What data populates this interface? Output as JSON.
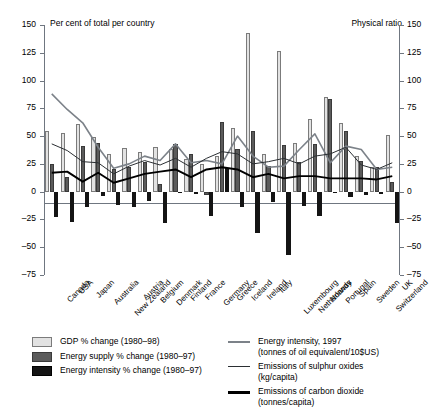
{
  "left_axis_title": "Per cent of total per country",
  "right_axis_title": "Physical ratio",
  "legend": {
    "bars": [
      {
        "key": "gdp",
        "label": "GDP % change (1980–98)",
        "color": "#e2e2e2"
      },
      {
        "key": "supply",
        "label": "Energy supply % change (1980–97)",
        "color": "#5b5b5b"
      },
      {
        "key": "intensity",
        "label": "Energy intensity % change (1980–97)",
        "color": "#141414"
      }
    ],
    "lines": [
      {
        "key": "energy_intensity_1997",
        "label_line1": "Energy intensity, 1997",
        "label_line2": "(tonnes of oil equivalent/10$US)",
        "color": "#7c8289"
      },
      {
        "key": "sulphur_oxides",
        "label_line1": "Emissions of sulphur oxides",
        "label_line2": "(kg/capita)",
        "color": "#2b2f33"
      },
      {
        "key": "carbon_dioxide",
        "label_line1": "Emissions of carbon dioxide",
        "label_line2": "(tonnes/capita)",
        "color": "#000000"
      }
    ]
  },
  "chart_data": {
    "type": "bar",
    "title": "",
    "xlabel": "",
    "ylabel": "Per cent of total per country",
    "y2label": "Physical ratio",
    "ylim": [
      -75,
      150
    ],
    "y2lim": [
      -75,
      150
    ],
    "yticks": [
      150,
      125,
      100,
      75,
      50,
      25,
      0,
      -25,
      -50,
      -75
    ],
    "ytick_labels": [
      "150",
      "125",
      "100",
      "75",
      "50",
      "25",
      "0",
      "–25",
      "–50",
      "–75"
    ],
    "y2tick_labels": [
      "150",
      "125",
      "100",
      "75",
      "50",
      "25",
      "0",
      "–25",
      "–50",
      "–75"
    ],
    "grid": false,
    "legend_position": "below",
    "categories": [
      "Canada",
      "USA",
      "Japan",
      "Australia",
      "New Zealand",
      "Austria",
      "Belgium",
      "Denmark",
      "Finland",
      "France",
      "Germany",
      "Greece",
      "Iceland",
      "Ireland",
      "Italy",
      "Luxembourg",
      "Netherlands",
      "Norway",
      "Portugal",
      "Spain",
      "Sweden",
      "Switzerland",
      "UK"
    ],
    "series": [
      {
        "name": "GDP % change (1980–98)",
        "type": "bar",
        "color": "#e2e2e2",
        "values": [
          55,
          53,
          61,
          49,
          34,
          39,
          36,
          40,
          38,
          29,
          25,
          32,
          57,
          143,
          34,
          127,
          44,
          65,
          85,
          62,
          32,
          22,
          51
        ]
      },
      {
        "name": "Energy supply % change (1980–97)",
        "type": "bar",
        "color": "#5b5b5b",
        "values": [
          25,
          13,
          41,
          44,
          20,
          22,
          27,
          7,
          43,
          34,
          -3,
          63,
          38,
          55,
          23,
          42,
          27,
          43,
          83,
          55,
          28,
          22,
          9
        ]
      },
      {
        "name": "Energy intensity % change (1980–97)",
        "type": "bar",
        "color": "#141414",
        "values": [
          -23,
          -27,
          -14,
          -4,
          -12,
          -14,
          -8,
          -28,
          -1,
          -2,
          -22,
          21,
          -14,
          -37,
          -9,
          -57,
          -13,
          -22,
          -1,
          -5,
          -3,
          -2,
          -28
        ]
      },
      {
        "name": "Energy intensity, 1997 (tonnes of oil equivalent/10$US)",
        "type": "line",
        "color": "#7c8289",
        "values": [
          88,
          74,
          62,
          40,
          21,
          25,
          32,
          28,
          43,
          26,
          28,
          25,
          50,
          32,
          22,
          23,
          38,
          52,
          26,
          41,
          38,
          20,
          22
        ]
      },
      {
        "name": "Emissions of sulphur oxides (kg/capita)",
        "type": "line",
        "color": "#2b2f33",
        "values": [
          43,
          37,
          27,
          26,
          16,
          23,
          28,
          24,
          30,
          22,
          30,
          36,
          34,
          25,
          27,
          30,
          25,
          32,
          34,
          40,
          24,
          20,
          26
        ]
      },
      {
        "name": "Emissions of carbon dioxide (tonnes/capita)",
        "type": "line",
        "color": "#000000",
        "values": [
          17,
          18,
          9,
          17,
          8,
          12,
          16,
          18,
          20,
          13,
          20,
          22,
          20,
          13,
          16,
          12,
          14,
          14,
          12,
          12,
          12,
          11,
          14
        ]
      }
    ]
  }
}
